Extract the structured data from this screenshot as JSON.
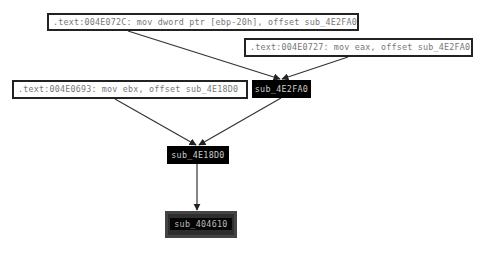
{
  "graph": {
    "references": [
      {
        "id": "ref1",
        "text": ".text:004E072C: mov dword ptr [ebp-20h], offset sub_4E2FA0"
      },
      {
        "id": "ref2",
        "text": ".text:004E0727: mov eax, offset sub_4E2FA0"
      },
      {
        "id": "ref3",
        "text": ".text:004E0693: mov ebx, offset sub_4E18D0"
      }
    ],
    "nodes": [
      {
        "id": "sub_4E2FA0",
        "label": "sub_4E2FA0"
      },
      {
        "id": "sub_4E18D0",
        "label": "sub_4E18D0"
      },
      {
        "id": "sub_404610",
        "label": "sub_404610"
      }
    ],
    "edges": [
      {
        "from": "ref1",
        "to": "sub_4E2FA0"
      },
      {
        "from": "ref2",
        "to": "sub_4E2FA0"
      },
      {
        "from": "sub_4E2FA0",
        "to": "sub_4E18D0"
      },
      {
        "from": "ref3",
        "to": "sub_4E18D0"
      },
      {
        "from": "sub_4E18D0",
        "to": "sub_404610"
      }
    ]
  },
  "colors": {
    "edge": "#333333",
    "node_bg": "#000000",
    "target_bg": "#2e2e2e",
    "ref_border": "#222222",
    "ref_text": "#777777"
  }
}
